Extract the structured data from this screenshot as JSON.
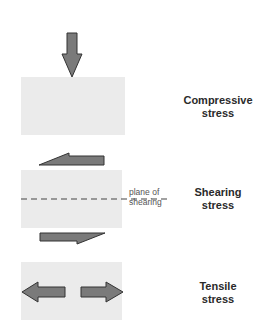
{
  "colors": {
    "block_fill": "#ebebeb",
    "arrow_fill": "#7a7a7a",
    "arrow_stroke": "#333333",
    "label_text": "#2a2a2a"
  },
  "panels": [
    {
      "id": "compressive",
      "label_line1": "Compressive",
      "label_line2": "stress",
      "arrows": [
        "down-arrow"
      ]
    },
    {
      "id": "shearing",
      "label_line1": "Shearing",
      "label_line2": "stress",
      "arrows": [
        "left-arrow-top",
        "right-arrow-bottom"
      ],
      "plane_label_line1": "plane of",
      "plane_label_line2": "shearing"
    },
    {
      "id": "tensile",
      "label_line1": "Tensile",
      "label_line2": "stress",
      "arrows": [
        "left-arrow",
        "right-arrow"
      ]
    }
  ]
}
